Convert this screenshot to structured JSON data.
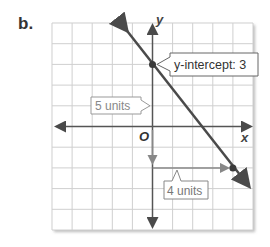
{
  "problem_label": "b.",
  "axes": {
    "x_label": "x",
    "y_label": "y",
    "origin_label": "O"
  },
  "annotations": {
    "y_intercept": "y-intercept: 3",
    "rise": "5 units",
    "run": "4 units"
  },
  "colors": {
    "grid": "#cfcfcf",
    "axis": "#555555",
    "line": "#4a4a4a",
    "arrow_gray": "#888888"
  },
  "graph": {
    "grid_range": {
      "x": [
        -5,
        5
      ],
      "y": [
        -5,
        5
      ]
    },
    "line_points": [
      [
        0,
        3
      ],
      [
        4,
        -2
      ]
    ],
    "slope": "-5/4",
    "y_intercept": 3
  }
}
